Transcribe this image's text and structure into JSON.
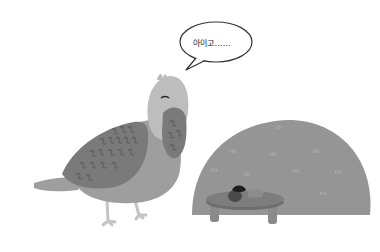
{
  "scene": {
    "description": "Illustration of a grey pigeon covering its face with its wing beside a grassy mound with a small table holding an acorn",
    "colors": {
      "background": "#ffffff",
      "bird_head": "#bdbdbd",
      "bird_body": "#9e9e9e",
      "bird_wing": "#7a7a7a",
      "wing_pattern": "#5e5e5e",
      "bird_legs": "#c4c4c4",
      "mound": "#959595",
      "grass_tuft": "#b0b0b0",
      "table_top": "#7d7d7d",
      "table_legs": "#8a8a8a",
      "acorn_cap": "#1e1e1e",
      "acorn_body": "#4a4a4a"
    }
  },
  "speech_bubble": {
    "text": "아이고……"
  }
}
